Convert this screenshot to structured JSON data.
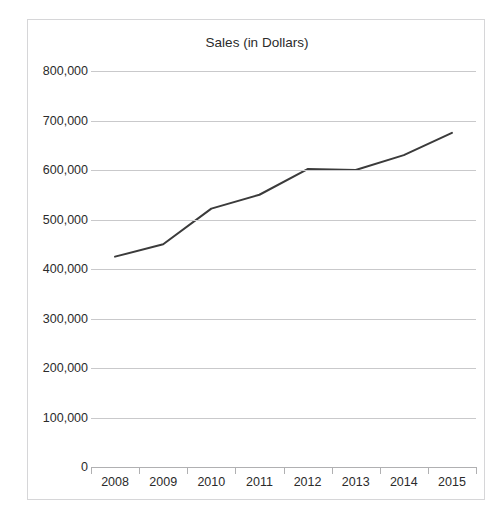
{
  "top_clipped_text": " ",
  "chart_data": {
    "type": "line",
    "title": "Sales (in Dollars)",
    "xlabel": "",
    "ylabel": "",
    "categories": [
      "2008",
      "2009",
      "2010",
      "2011",
      "2012",
      "2013",
      "2014",
      "2015"
    ],
    "values": [
      425000,
      450000,
      522000,
      550000,
      602000,
      600000,
      630000,
      675000
    ],
    "series": [
      {
        "name": "Sales (in Dollars)",
        "values": [
          425000,
          450000,
          522000,
          550000,
          602000,
          600000,
          630000,
          675000
        ]
      }
    ],
    "ylim": [
      0,
      800000
    ],
    "ytick_values": [
      0,
      100000,
      200000,
      300000,
      400000,
      500000,
      600000,
      700000,
      800000
    ],
    "ytick_labels": [
      "0",
      "100,000",
      "200,000",
      "300,000",
      "400,000",
      "500,000",
      "600,000",
      "700,000",
      "800,000"
    ],
    "grid": true,
    "legend": false,
    "legend_position": "none",
    "line_color": "#3b3b3b",
    "gridline_color": "#c9c9cb",
    "axis_color": "#b0b0b2",
    "background_color": "#ffffff",
    "border_color": "#d6d6d8",
    "text_color": "#2b2b2b",
    "markers": false
  }
}
